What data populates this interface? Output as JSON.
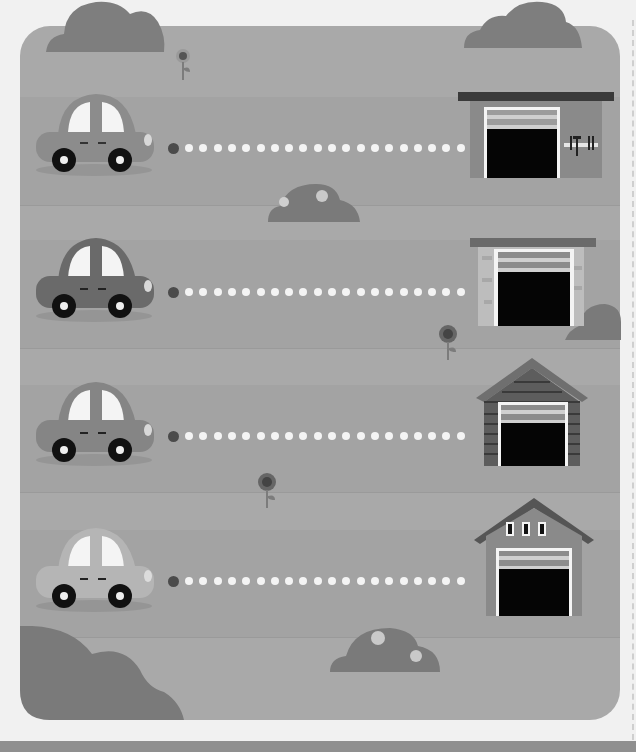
{
  "worksheet": {
    "activity": "trace-path-car-to-garage",
    "rows": [
      {
        "id": 1,
        "car": {
          "body": "#8c8c8c",
          "roof": "#8c8c8c",
          "label": "car-1"
        },
        "garage": {
          "style": "flat-roof-with-tools",
          "label": "garage-1"
        },
        "dot_count": 20
      },
      {
        "id": 2,
        "car": {
          "body": "#6a6a6a",
          "roof": "#6a6a6a",
          "label": "car-2"
        },
        "garage": {
          "style": "flat-roof-brick",
          "label": "garage-2"
        },
        "dot_count": 20
      },
      {
        "id": 3,
        "car": {
          "body": "#858585",
          "roof": "#858585",
          "label": "car-3"
        },
        "garage": {
          "style": "wooden-gable",
          "label": "garage-3"
        },
        "dot_count": 20
      },
      {
        "id": 4,
        "car": {
          "body": "#b5b5b5",
          "roof": "#b5b5b5",
          "label": "car-4"
        },
        "garage": {
          "style": "gable-with-windows",
          "label": "garage-4"
        },
        "dot_count": 20
      }
    ]
  },
  "colors": {
    "page_bg": "#f1f1f1",
    "panel_bg": "#a9a9a9",
    "cloud": "#7e7e7e",
    "bush": "#7a7a7a",
    "garage_door": "#050505",
    "start_dot": "#4b4b4b",
    "path_dot": "#f4f4f4"
  }
}
